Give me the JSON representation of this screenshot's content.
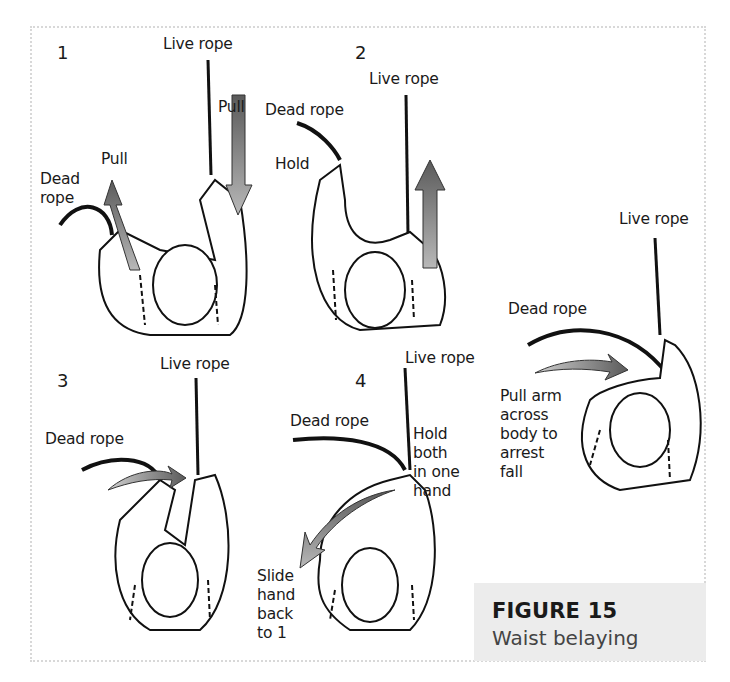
{
  "figure": {
    "number_label": "FIGURE 15",
    "title": "Waist belaying"
  },
  "panels": [
    {
      "step": "1",
      "labels": {
        "live_rope": "Live rope",
        "pull_right": "Pull",
        "pull_left": "Pull",
        "dead_rope": "Dead\nrope"
      }
    },
    {
      "step": "2",
      "labels": {
        "live_rope": "Live rope",
        "dead_rope": "Dead rope",
        "hold": "Hold"
      }
    },
    {
      "step": "3",
      "labels": {
        "live_rope": "Live rope",
        "dead_rope": "Dead rope"
      }
    },
    {
      "step": "4",
      "labels": {
        "live_rope": "Live rope",
        "dead_rope": "Dead rope",
        "hold_both": "Hold\nboth\n  in one\n   hand",
        "slide_hand": "Slide\nhand\nback\nto 1"
      }
    },
    {
      "step": "",
      "labels": {
        "live_rope": "Live rope",
        "dead_rope": "Dead rope",
        "pull_arm": "Pull arm\nacross\nbody to\narrest\nfall"
      }
    }
  ],
  "colors": {
    "arrow_fill": "#6e6e6e",
    "caption_bg": "#ececec",
    "border": "#d8d8d8"
  }
}
